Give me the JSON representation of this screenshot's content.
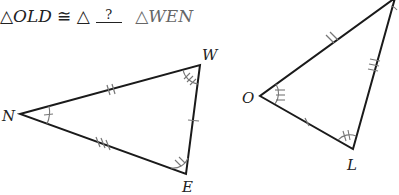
{
  "statement": {
    "left_triangle_symbol": "△",
    "left_triangle": "OLD",
    "congruent_symbol": "≅",
    "middle_triangle_symbol": "△",
    "blank": "?",
    "right_triangle_symbol": "△",
    "right_triangle": "WEN"
  },
  "triangle_1": {
    "vertices": [
      {
        "label": "N",
        "x": 20,
        "y": 114
      },
      {
        "label": "W",
        "x": 200,
        "y": 65
      },
      {
        "label": "E",
        "x": 186,
        "y": 174
      }
    ],
    "side_ticks": {
      "NW": 2,
      "NE": 3,
      "WE": 1
    },
    "angle_arcs": {
      "N": 1,
      "W": 3,
      "E": 2
    }
  },
  "triangle_2": {
    "vertices": [
      {
        "label": "O",
        "x": 260,
        "y": 96
      },
      {
        "label": "L",
        "x": 353,
        "y": 149
      },
      {
        "label": "D",
        "x": 395,
        "y": 0
      }
    ],
    "side_ticks": {
      "OL": 1,
      "OD": 2,
      "LD": 3
    },
    "angle_arcs": {
      "O": 3,
      "L": 2
    }
  },
  "colors": {
    "line": "#1a1a1a",
    "marks": "#777777",
    "text": "#222222"
  }
}
